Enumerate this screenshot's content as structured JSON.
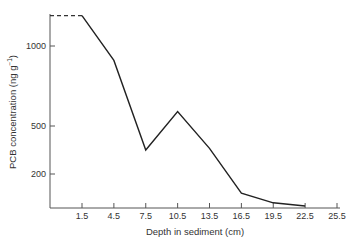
{
  "chart_data": {
    "type": "line",
    "title": "",
    "xlabel": "Depth in sediment (cm)",
    "ylabel": "PCB concentration (ng g⁻¹)",
    "x_ticks": [
      "1.5",
      "4.5",
      "7.5",
      "10.5",
      "13.5",
      "16.5",
      "19.5",
      "22.5",
      "25.5"
    ],
    "y_ticks": [
      "1000",
      "500",
      "200"
    ],
    "y_tick_values": [
      1000,
      500,
      200
    ],
    "xlim": [
      0,
      25.5
    ],
    "ylim": [
      0,
      1250
    ],
    "grid": false,
    "legend": null,
    "series": [
      {
        "name": "PCB concentration",
        "x": [
          1.5,
          4.5,
          7.5,
          10.5,
          13.5,
          16.5,
          19.5,
          22.5
        ],
        "values": [
          1190,
          910,
          350,
          590,
          360,
          80,
          20,
          0
        ],
        "style": "solid"
      },
      {
        "name": "extrapolated surface",
        "x": [
          0,
          1.5
        ],
        "values": [
          1190,
          1190
        ],
        "style": "dashed"
      }
    ]
  },
  "axes": {
    "x_title": "Depth in sediment (cm)",
    "y_title_main": "PCB concentration (ng g",
    "y_title_sup": "−1",
    "y_title_end": ")"
  }
}
